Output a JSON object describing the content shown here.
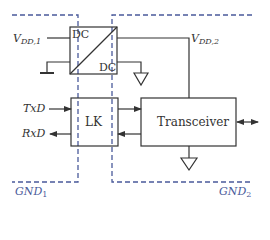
{
  "diagram": {
    "type": "isolated transceiver block diagram",
    "colors": {
      "line": "#333333",
      "isolation_boundary": "#4a5a9a",
      "background": "#ffffff"
    },
    "supply_labels": {
      "vdd1": {
        "main": "V",
        "sub": "DD,1"
      },
      "vdd2": {
        "main": "V",
        "sub": "DD,2"
      }
    },
    "converter": {
      "input_label": "DC",
      "output_label": "DC"
    },
    "isolator": {
      "label": "LK"
    },
    "transceiver": {
      "label": "Transceiver"
    },
    "signals": {
      "txd": "TxD",
      "rxd": "RxD"
    },
    "ground_domains": {
      "gnd1": {
        "main": "GND",
        "sub": "1"
      },
      "gnd2": {
        "main": "GND",
        "sub": "2"
      }
    }
  }
}
